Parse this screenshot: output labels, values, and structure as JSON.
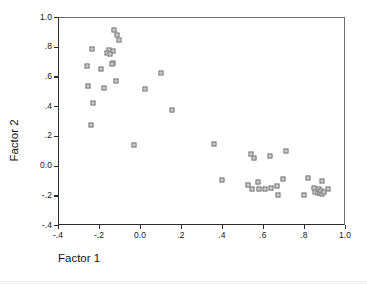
{
  "chart_data": {
    "type": "scatter",
    "title": "",
    "subtitle": "",
    "xlabel": "Factor 1",
    "ylabel": "Factor 2",
    "xlim": [
      -0.4,
      1.0
    ],
    "ylim": [
      -0.4,
      1.0
    ],
    "xticks": [
      -0.4,
      -0.2,
      0.0,
      0.2,
      0.4,
      0.6,
      0.8,
      1.0
    ],
    "xticklabels": [
      "-.4",
      "-.2",
      "0.0",
      ".2",
      ".4",
      ".6",
      ".8",
      "1.0"
    ],
    "yticks": [
      -0.4,
      -0.2,
      0.0,
      0.2,
      0.4,
      0.6,
      0.8,
      1.0
    ],
    "yticklabels": [
      "-.4",
      "-.2",
      "0.0",
      ".2",
      ".4",
      ".6",
      ".8",
      "1.0"
    ],
    "grid": false,
    "legend": null,
    "legend_position": "none",
    "marker": "open-square",
    "marker_color": "#5a5a5a",
    "frame_color": "#2b2b2b",
    "series": [
      {
        "name": "cases",
        "points": [
          [
            -0.125,
            0.915
          ],
          [
            -0.113,
            0.88
          ],
          [
            -0.102,
            0.848
          ],
          [
            -0.232,
            0.787
          ],
          [
            -0.152,
            0.78
          ],
          [
            -0.133,
            0.772
          ],
          [
            -0.16,
            0.76
          ],
          [
            -0.147,
            0.752
          ],
          [
            -0.133,
            0.692
          ],
          [
            -0.137,
            0.682
          ],
          [
            -0.258,
            0.672
          ],
          [
            -0.19,
            0.648
          ],
          [
            -0.117,
            0.572
          ],
          [
            -0.255,
            0.535
          ],
          [
            -0.175,
            0.525
          ],
          [
            -0.228,
            0.42
          ],
          [
            -0.238,
            0.275
          ],
          [
            0.103,
            0.625
          ],
          [
            0.022,
            0.515
          ],
          [
            0.157,
            0.375
          ],
          [
            -0.03,
            0.138
          ],
          [
            0.362,
            0.145
          ],
          [
            0.54,
            0.08
          ],
          [
            0.558,
            0.048
          ],
          [
            0.632,
            0.063
          ],
          [
            0.712,
            0.095
          ],
          [
            0.398,
            -0.1
          ],
          [
            0.528,
            -0.132
          ],
          [
            0.545,
            -0.158
          ],
          [
            0.575,
            -0.112
          ],
          [
            0.58,
            -0.155
          ],
          [
            0.608,
            -0.155
          ],
          [
            0.638,
            -0.15
          ],
          [
            0.668,
            -0.138
          ],
          [
            0.672,
            -0.198
          ],
          [
            0.697,
            -0.09
          ],
          [
            0.8,
            -0.195
          ],
          [
            0.818,
            -0.085
          ],
          [
            0.848,
            -0.148
          ],
          [
            0.852,
            -0.178
          ],
          [
            0.868,
            -0.182
          ],
          [
            0.875,
            -0.16
          ],
          [
            0.878,
            -0.185
          ],
          [
            0.882,
            -0.172
          ],
          [
            0.886,
            -0.19
          ],
          [
            0.89,
            -0.102
          ],
          [
            0.898,
            -0.178
          ],
          [
            0.918,
            -0.16
          ]
        ]
      }
    ]
  }
}
